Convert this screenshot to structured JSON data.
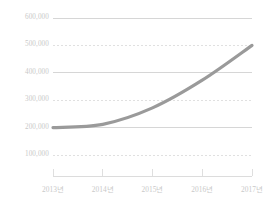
{
  "chart_data": {
    "type": "line",
    "title": "",
    "subtitle": "",
    "xlabel": "",
    "ylabel": "",
    "categories": [
      "2013년",
      "2014년",
      "2015년",
      "2016년",
      "2017년"
    ],
    "series": [
      {
        "name": "",
        "values": [
          200000,
          212000,
          272000,
          373000,
          500000
        ],
        "color": "#9a9a9a",
        "line_width": 3.2,
        "smooth": true,
        "markers": false
      }
    ],
    "ylim": [
      0,
      620000
    ],
    "yticks": [
      100000,
      200000,
      300000,
      400000,
      500000,
      600000
    ],
    "ytick_labels": [
      "100,000",
      "200,000",
      "300,000",
      "400,000",
      "500,000",
      "600,000"
    ],
    "xtick_labels": [
      "2013년",
      "2014년",
      "2015년",
      "2016년",
      "2017년"
    ],
    "grid": {
      "enabled": true,
      "solid_at": [
        200000,
        400000,
        600000
      ],
      "dashed_at": [
        100000,
        300000,
        500000
      ],
      "solid_color": "#d2d2d2",
      "dashed_color": "#d8d8d8"
    },
    "axis": {
      "x_axis_line": true,
      "x_axis_color": "#dcdcdc",
      "tick_marks": true,
      "tick_color": "#dcdcdc",
      "y_axis_line": false
    },
    "legend": {
      "visible": false,
      "position": "none"
    },
    "background_color": "#ffffff",
    "tick_label_color": "#c9c9c9"
  },
  "geometry": {
    "plot_left": 53,
    "plot_right": 252,
    "y_600000": 18,
    "y_100000": 155,
    "axis_y": 176,
    "xlabel_y": 186
  }
}
